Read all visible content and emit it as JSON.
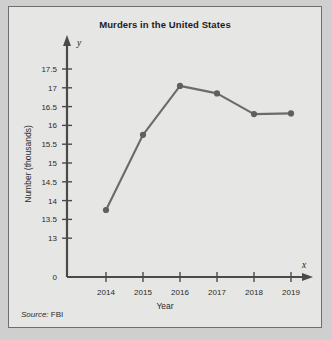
{
  "card": {
    "background": "#e6e6e4",
    "border_color": "#6e6e6e"
  },
  "chart_data": {
    "type": "line",
    "title": "Murders in the United States",
    "xlabel": "Year",
    "ylabel": "Number (thousands)",
    "categories": [
      "2014",
      "2015",
      "2016",
      "2017",
      "2018",
      "2019"
    ],
    "values": [
      13.75,
      15.75,
      17.05,
      16.85,
      16.3,
      16.32
    ],
    "x_tick_labels": [
      "2014",
      "2015",
      "2016",
      "2017",
      "2018",
      "2019"
    ],
    "y_tick_labels": [
      "0",
      "13",
      "13.5",
      "14",
      "14.5",
      "15",
      "15.5",
      "16",
      "16.5",
      "17",
      "17.5"
    ],
    "y_tick_values": [
      0,
      13,
      13.5,
      14,
      14.5,
      15,
      15.5,
      16,
      16.5,
      17,
      17.5
    ],
    "ylim": [
      12.75,
      17.75
    ],
    "xlim": [
      2013.5,
      2019.8
    ],
    "grid": false,
    "legend": null,
    "x_axis_letter": "x",
    "y_axis_letter": "y",
    "line_color": "#6b6b6b",
    "marker_color": "#5f5f5f",
    "axis_color": "#4a4a4a"
  },
  "source": {
    "word": "Source:",
    "value": "FBI"
  }
}
